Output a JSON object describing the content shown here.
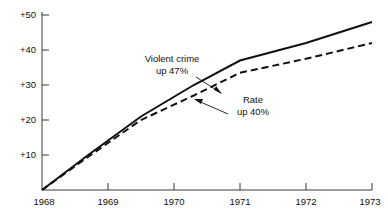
{
  "chart_data": {
    "type": "line",
    "title": "",
    "subtitle": "",
    "xlabel": "",
    "ylabel": "",
    "x": [
      1968,
      1969,
      1970,
      1971,
      1972,
      1973
    ],
    "xlim": [
      1968,
      1973
    ],
    "ylim": [
      0,
      50
    ],
    "grid": false,
    "legend_position": "none",
    "x_tick_labels": [
      "1968",
      "1969",
      "1970",
      "1971",
      "1972",
      "1973"
    ],
    "y_tick_labels": [
      "+10",
      "+20",
      "+30",
      "+40",
      "+50"
    ],
    "y_tick_values": [
      10,
      20,
      30,
      40,
      50
    ],
    "series": [
      {
        "name": "Violent crime",
        "style": "solid",
        "color": "#111111",
        "values": [
          0,
          10,
          21,
          30,
          37,
          42,
          48
        ],
        "x_values": [
          1968,
          1968.7,
          1969.5,
          1970.3,
          1971,
          1972,
          1973
        ]
      },
      {
        "name": "Rate",
        "style": "dashed",
        "color": "#111111",
        "values": [
          0,
          9.5,
          20,
          27,
          33.5,
          37.5,
          42
        ],
        "x_values": [
          1968,
          1968.7,
          1969.5,
          1970.3,
          1971,
          1972,
          1973
        ]
      }
    ],
    "annotations": [
      {
        "id": "violent-crime-annotation",
        "line1": "Violent crime",
        "line2": "up 47%",
        "target_series": "Violent crime"
      },
      {
        "id": "rate-annotation",
        "line1": "Rate",
        "line2": "up 40%",
        "target_series": "Rate"
      }
    ]
  },
  "colors": {
    "axis": "#3a3a3a",
    "ink": "#111111",
    "background": "#ffffff"
  }
}
